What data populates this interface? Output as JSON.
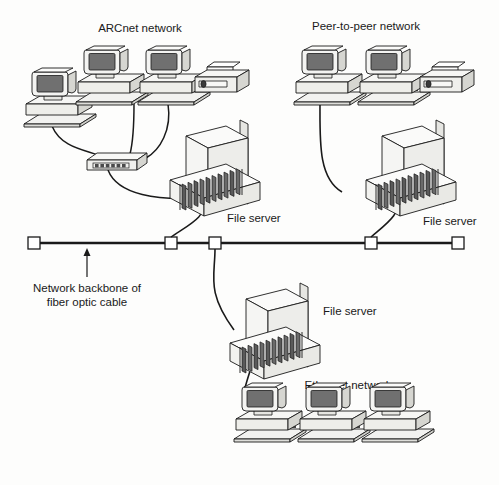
{
  "diagram": {
    "title_visible": false,
    "type": "network-topology-diagram",
    "colors": {
      "line": "#1a1a1a",
      "screen_fill": "#707070",
      "case_fill": "#f2f2f0",
      "case_shade": "#d8d8d4",
      "slot_fill": "#555555",
      "background": "#fdfdfc"
    },
    "labels": {
      "arcnet": "ARCnet network",
      "peer_to_peer": "Peer-to-peer network",
      "ethernet": "Ethernet network",
      "file_server_left": "File server",
      "file_server_right": "File server",
      "file_server_bottom": "File server",
      "backbone_line1": "Network backbone of",
      "backbone_line2": "fiber optic cable"
    },
    "segments": [
      {
        "name": "arcnet-segment",
        "label": "ARCnet network",
        "workstations": 3,
        "printers": 1,
        "hub": true,
        "file_server": "File server",
        "topology": "star"
      },
      {
        "name": "peer-to-peer-segment",
        "label": "Peer-to-peer network",
        "workstations": 2,
        "printers": 1,
        "hub": false,
        "file_server": "File server",
        "topology": "bus"
      },
      {
        "name": "ethernet-segment",
        "label": "Ethernet network",
        "workstations": 3,
        "printers": 0,
        "hub": false,
        "file_server": "File server",
        "topology": "bus"
      }
    ],
    "backbone": {
      "name": "fiber-optic-backbone",
      "connector_count": 4,
      "connector_x": [
        34,
        171,
        215,
        371
      ],
      "end_x": [
        34,
        458
      ],
      "y": 243,
      "annotation": "Network backbone of fiber optic cable"
    }
  }
}
